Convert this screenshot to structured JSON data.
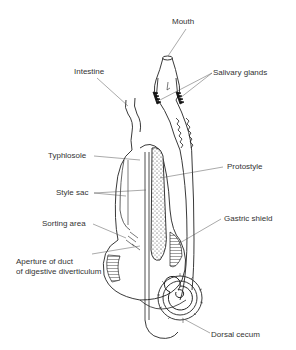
{
  "diagram": {
    "labels": {
      "mouth": "Mouth",
      "intestine": "Intestine",
      "salivary_glands": "Salivary glands",
      "typhlosole": "Typhlosole",
      "protostyle": "Protostyle",
      "style_sac": "Style sac",
      "gastric_shield": "Gastric shield",
      "sorting_area": "Sorting area",
      "aperture_line1": "Aperture of duct",
      "aperture_line2": "of digestive diverticulum",
      "dorsal_cecum": "Dorsal cecum"
    },
    "colors": {
      "ink": "#222222",
      "leader": "#555555",
      "text": "#333333",
      "background": "#ffffff"
    }
  }
}
